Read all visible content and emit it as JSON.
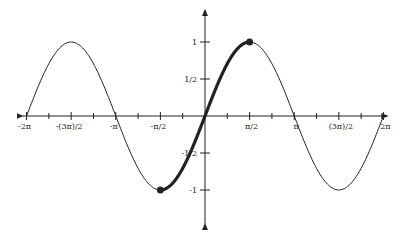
{
  "chart_data": {
    "type": "line",
    "title": "",
    "function": "sin(x)",
    "xlabel": "",
    "ylabel": "",
    "xlim": [
      -6.2832,
      6.2832
    ],
    "ylim": [
      -1.3,
      1.3
    ],
    "grid": false,
    "x_ticks": [
      "-2π",
      "-(3π)/2",
      "-π",
      "-π/2",
      "π/2",
      "π",
      "(3π)/2",
      "2π"
    ],
    "y_ticks": [
      "1",
      "1/2",
      "-1/2",
      "-1"
    ],
    "series": [
      {
        "name": "sin(x)",
        "domain": [
          -6.2832,
          6.2832
        ],
        "style": "thin"
      },
      {
        "name": "sin(x) restricted",
        "domain": [
          -1.5708,
          1.5708
        ],
        "style": "bold"
      }
    ],
    "points": [
      {
        "label": "(-π/2, -1)",
        "x": -1.5708,
        "y": -1
      },
      {
        "label": "(π/2, 1)",
        "x": 1.5708,
        "y": 1
      }
    ]
  }
}
